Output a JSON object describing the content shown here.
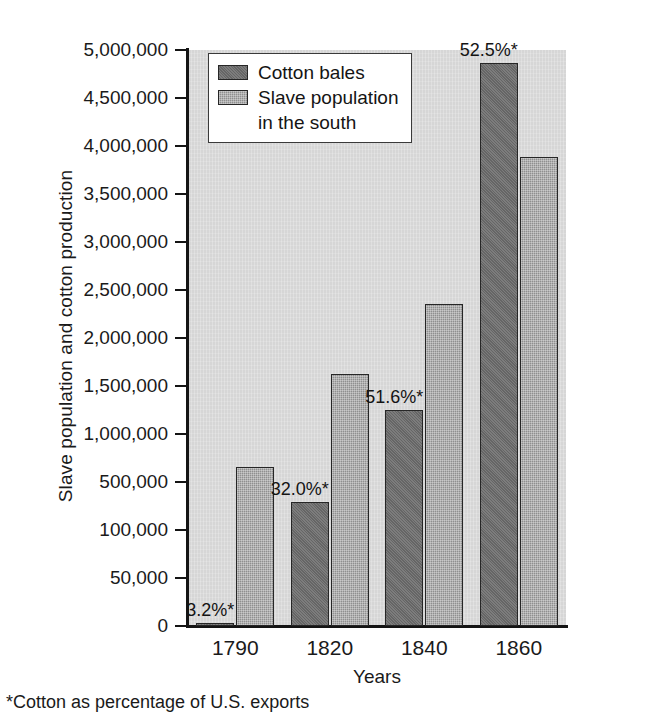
{
  "chart_data": {
    "type": "bar",
    "title": "",
    "xlabel": "Years",
    "ylabel": "Slave population and cotton production",
    "categories": [
      "1790",
      "1820",
      "1840",
      "1860"
    ],
    "series": [
      {
        "name": "Cotton bales",
        "color": "#6e6e6e",
        "values": [
          3000,
          335000,
          1250000,
          4860000
        ]
      },
      {
        "name": "Slave population in the south",
        "color": "#8f8f8f",
        "values": [
          660000,
          1620000,
          2350000,
          3890000
        ]
      }
    ],
    "annotations": [
      {
        "category": "1790",
        "text": "3.2%*"
      },
      {
        "category": "1820",
        "text": "32.0%*"
      },
      {
        "category": "1840",
        "text": "51.6%*"
      },
      {
        "category": "1860",
        "text": "52.5%*"
      }
    ],
    "ytick_labels": [
      "0",
      "50,000",
      "100,000",
      "500,000",
      "1,000,000",
      "1,500,000",
      "2,000,000",
      "2,500,000",
      "3,000,000",
      "3,500,000",
      "4,000,000",
      "4,500,000",
      "5,000,000"
    ],
    "ytick_values": [
      0,
      50000,
      100000,
      500000,
      1000000,
      1500000,
      2000000,
      2500000,
      3000000,
      3500000,
      4000000,
      4500000,
      5000000
    ],
    "axis_note": "non-uniform y-axis: evenly spaced ticks over unequal value intervals",
    "ylim": [
      0,
      5000000
    ],
    "grid": false,
    "legend_position": "top-left-inside",
    "footnote": "*Cotton as percentage of U.S. exports",
    "plot_background": "#d6d6d6"
  },
  "legend": {
    "items": [
      {
        "label": "Cotton bales",
        "sublabel": ""
      },
      {
        "label": "Slave population",
        "sublabel": "in the south"
      }
    ]
  },
  "axes": {
    "y_title": "Slave population and cotton production",
    "x_title": "Years"
  },
  "footnote": {
    "text": "*Cotton as percentage of U.S. exports"
  }
}
